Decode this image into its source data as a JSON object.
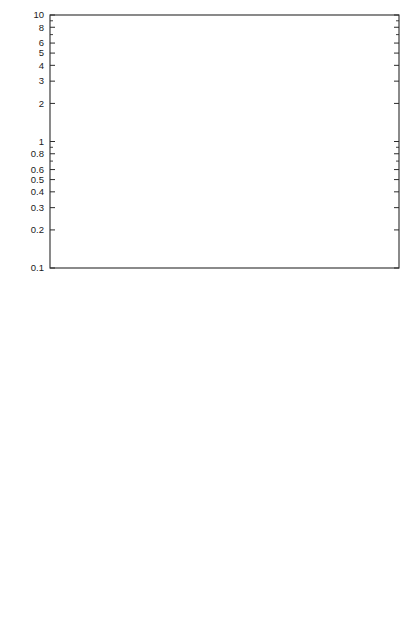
{
  "figure": {
    "panels": [
      {
        "id": "panel-top",
        "axis": {
          "xlabel": "temperature (K)",
          "ylabel_parts": {
            "lead": "rate coefficient (10",
            "exp1": "-10",
            "mid": " cm",
            "exp2": "3",
            "mid2": " molecule",
            "exp3": "-1",
            "mid3": " s",
            "exp4": "-1",
            "tail": ")"
          },
          "ylabel_plain": "rate coefficient (10-10 cm3 molecule-1 s-1)",
          "xlim": [
            10,
            400
          ],
          "ylim": [
            0.1,
            10
          ],
          "xscale": "log",
          "yscale": "log",
          "xticks": [
            10,
            100
          ],
          "xticklabels": [
            "10",
            "100"
          ],
          "yticks": [
            0.1,
            0.2,
            0.3,
            0.4,
            0.5,
            0.6,
            0.8,
            1,
            2,
            3,
            4,
            5,
            6,
            8,
            10
          ],
          "yticklabels": [
            "0.1",
            "0.2",
            "0.3",
            "0.4",
            "0.5",
            "0.6",
            "0.8",
            "1",
            "2",
            "3",
            "4",
            "5",
            "6",
            "8",
            "10"
          ],
          "grid": false
        },
        "legend": {
          "position": "lower-left",
          "entries": [
            {
              "marker": "filled-circle",
              "label": "CH + C2H4"
            },
            {
              "marker": "filled-triangle",
              "label": "C2H + C2H4"
            },
            {
              "marker": "open-square",
              "label": "C4H + C2H4"
            }
          ]
        }
      },
      {
        "id": "panel-bot",
        "axis": {
          "xlabel": "temperature (K)",
          "ylabel_plain": "rate coefficient (10-10 cm3 molecule-1 s-1)",
          "xlim": [
            10,
            400
          ],
          "ylim": [
            1,
            10
          ],
          "xscale": "log",
          "yscale": "log",
          "xticks": [
            10,
            100
          ],
          "xticklabels": [
            "10",
            "100"
          ],
          "yticks": [
            1,
            2,
            3,
            4,
            5,
            6,
            8,
            10
          ],
          "yticklabels": [
            "1",
            "2",
            "3",
            "4",
            "5",
            "6",
            "8",
            "10"
          ],
          "grid": false
        },
        "legend": {
          "position": "lower-left",
          "entries": [
            {
              "marker": "filled-square",
              "label": "C(3P) + C2H4"
            },
            {
              "marker": "open-circle",
              "label": "C2(1Sg+) + C2H4"
            }
          ]
        }
      }
    ]
  },
  "chart_data": [
    {
      "type": "scatter",
      "panel": "top",
      "title": "",
      "xlabel": "temperature (K)",
      "ylabel": "rate coefficient (10^-10 cm^3 molecule^-1 s^-1)",
      "xscale": "log",
      "yscale": "log",
      "xlim": [
        10,
        400
      ],
      "ylim": [
        0.1,
        10
      ],
      "grid": false,
      "legend_position": "lower-left",
      "series": [
        {
          "name": "CH + C2H4",
          "marker": "filled-circle",
          "points": [
            {
              "x": 23,
              "y": 4.0,
              "yerr_low": 0.25,
              "yerr_high": 0.25
            },
            {
              "x": 43,
              "y": 5.0,
              "yerr_low": 0.2,
              "yerr_high": 0.2
            },
            {
              "x": 75,
              "y": 5.15,
              "yerr_low": 0.35,
              "yerr_high": 0.35
            },
            {
              "x": 170,
              "y": 4.35,
              "yerr_low": 0.3,
              "yerr_high": 0.3
            },
            {
              "x": 295,
              "y": 3.1,
              "yerr_low": 0.25,
              "yerr_high": 0.25
            }
          ]
        },
        {
          "name": "C2H + C2H4",
          "marker": "filled-triangle",
          "points": [
            {
              "x": 15,
              "y": 2.2,
              "yerr_low": 0.22,
              "yerr_high": 0.22
            },
            {
              "x": 28,
              "y": 2.4,
              "yerr_low": 0.0,
              "yerr_high": 0.0
            },
            {
              "x": 39,
              "y": 1.8,
              "yerr_low": 0.47,
              "yerr_high": 0.53
            },
            {
              "x": 55,
              "y": 2.4,
              "yerr_low": 0.0,
              "yerr_high": 0.0
            },
            {
              "x": 100,
              "y": 1.5,
              "yerr_low": 0.48,
              "yerr_high": 0.5
            },
            {
              "x": 110,
              "y": 1.72,
              "yerr_low": 0.0,
              "yerr_high": 0.0
            },
            {
              "x": 295,
              "y": 1.28,
              "yerr_low": 0.13,
              "yerr_high": 0.13
            },
            {
              "x": 295,
              "y": 1.05,
              "yerr_low": 0.0,
              "yerr_high": 0.0
            }
          ]
        },
        {
          "name": "C4H + C2H4",
          "marker": "open-square",
          "points": [
            {
              "x": 38,
              "y": 5.7,
              "yerr_low": 0.0,
              "yerr_high": 0.0
            },
            {
              "x": 55,
              "y": 5.0,
              "yerr_low": 0.0,
              "yerr_high": 0.0
            },
            {
              "x": 84,
              "y": 3.25,
              "yerr_low": 0.0,
              "yerr_high": 0.0
            },
            {
              "x": 145,
              "y": 3.38,
              "yerr_low": 0.0,
              "yerr_high": 0.0
            },
            {
              "x": 295,
              "y": 1.9,
              "yerr_low": 0.0,
              "yerr_high": 0.0
            }
          ]
        }
      ]
    },
    {
      "type": "scatter",
      "panel": "bottom",
      "title": "",
      "xlabel": "temperature (K)",
      "ylabel": "rate coefficient (10^-10 cm^3 molecule^-1 s^-1)",
      "xscale": "log",
      "yscale": "log",
      "xlim": [
        10,
        400
      ],
      "ylim": [
        1,
        10
      ],
      "grid": false,
      "legend_position": "lower-left",
      "series": [
        {
          "name": "C(3P) + C2H4",
          "marker": "filled-square",
          "points": [
            {
              "x": 15,
              "y": 3.43,
              "yerr_low": 0.42,
              "yerr_high": 0.42
            },
            {
              "x": 30,
              "y": 3.88,
              "yerr_low": 0.17,
              "yerr_high": 0.17
            },
            {
              "x": 53,
              "y": 4.13,
              "yerr_low": 0.17,
              "yerr_high": 0.17
            },
            {
              "x": 65,
              "y": 3.56,
              "yerr_low": 0.34,
              "yerr_high": 0.34
            },
            {
              "x": 83,
              "y": 3.21,
              "yerr_low": 0.14,
              "yerr_high": 0.14
            },
            {
              "x": 110,
              "y": 3.3,
              "yerr_low": 0.12,
              "yerr_high": 0.12
            },
            {
              "x": 205,
              "y": 3.28,
              "yerr_low": 0.12,
              "yerr_high": 0.12
            },
            {
              "x": 300,
              "y": 2.88,
              "yerr_low": 0.06,
              "yerr_high": 0.06
            }
          ]
        },
        {
          "name": "C2(1Sg+) + C2H4",
          "marker": "open-circle",
          "points": [
            {
              "x": 25,
              "y": 3.48,
              "yerr_low": 0.55,
              "yerr_high": 0.55
            },
            {
              "x": 38,
              "y": 3.54,
              "yerr_low": 0.42,
              "yerr_high": 0.42
            },
            {
              "x": 50,
              "y": 4.58,
              "yerr_low": 0.7,
              "yerr_high": 0.72
            },
            {
              "x": 83,
              "y": 3.7,
              "yerr_low": 0.5,
              "yerr_high": 0.5
            },
            {
              "x": 148,
              "y": 3.88,
              "yerr_low": 0.53,
              "yerr_high": 0.52
            },
            {
              "x": 205,
              "y": 3.3,
              "yerr_low": 0.52,
              "yerr_high": 0.52
            },
            {
              "x": 300,
              "y": 1.85,
              "yerr_low": 0.4,
              "yerr_high": 0.52
            }
          ]
        }
      ]
    }
  ]
}
